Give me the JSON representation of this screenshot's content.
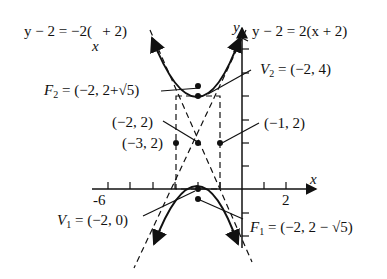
{
  "diagram": {
    "type": "hyperbola-graph",
    "axes": {
      "x_label": "x",
      "y_label": "y",
      "x_tick_labels": [
        "-6",
        "2"
      ]
    },
    "asymptotes": [
      {
        "lhs": "y − 2 = −2(",
        "var": "x",
        "rhs": " + 2)"
      },
      {
        "lhs": "y − 2 = 2(x + 2)"
      }
    ],
    "points": {
      "F2": {
        "name": "F",
        "sub": "2",
        "text": " = (−2, 2+√5)"
      },
      "V2": {
        "name": "V",
        "sub": "2",
        "text": " = (−2, 4)"
      },
      "center": {
        "text": "(−2, 2)"
      },
      "left": {
        "text": "(−3, 2)"
      },
      "right": {
        "text": "(−1, 2)"
      },
      "V1": {
        "name": "V",
        "sub": "1",
        "text": " = (−2, 0)"
      },
      "F1": {
        "name": "F",
        "sub": "1",
        "text": " = (−2, 2 − √5)"
      }
    }
  }
}
